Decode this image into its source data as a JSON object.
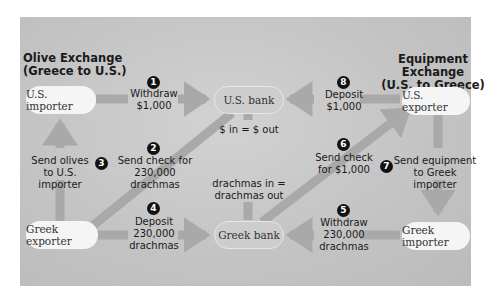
{
  "colors": {
    "panel": "#c6c6c6",
    "arrow": "#a9a9a9",
    "node_fill": "#f5f5f5",
    "bank_fill": "#cdcdcd"
  },
  "titles": {
    "left": "Olive Exchange\n(Greece to U.S.)",
    "right": "Equipment Exchange\n(U.S. to Greece)"
  },
  "nodes": {
    "us_importer": "U.S. importer",
    "us_bank": "U.S. bank",
    "us_exporter": "U.S. exporter",
    "greek_exporter": "Greek exporter",
    "greek_bank": "Greek bank",
    "greek_importer": "Greek importer"
  },
  "steps": [
    {
      "number": "1",
      "label": "Withdraw\n$1,000"
    },
    {
      "number": "2",
      "label": "Send check for\n230,000 drachmas"
    },
    {
      "number": "3",
      "label": "Send olives\nto U.S. importer"
    },
    {
      "number": "4",
      "label": "Deposit\n230,000\ndrachmas"
    },
    {
      "number": "5",
      "label": "Withdraw\n230,000\ndrachmas"
    },
    {
      "number": "6",
      "label": "Send check\nfor $1,000"
    },
    {
      "number": "7",
      "label": "Send equipment\nto Greek importer"
    },
    {
      "number": "8",
      "label": "Deposit\n$1,000"
    }
  ],
  "balances": {
    "us_bank": "$ in = $ out",
    "greek_bank": "drachmas in =\ndrachmas out"
  }
}
